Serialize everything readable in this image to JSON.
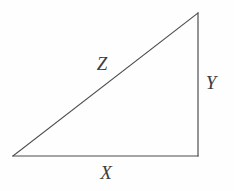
{
  "figure": {
    "type": "right-triangle-diagram",
    "background_color": "#fefefe",
    "stroke_color": "#4d4d4d",
    "stroke_width": 1.2,
    "label_color": "#3d3d3d",
    "width": 234,
    "height": 191,
    "vertices": {
      "left": {
        "x": 13,
        "y": 156
      },
      "bottom_right": {
        "x": 198,
        "y": 156
      },
      "top_right": {
        "x": 198,
        "y": 13
      }
    },
    "sides": [
      {
        "name": "hypotenuse",
        "label": "Z",
        "from": "left",
        "to": "top_right",
        "label_x": 102,
        "label_y": 63
      },
      {
        "name": "base",
        "label": "X",
        "from": "left",
        "to": "bottom_right",
        "label_x": 106,
        "label_y": 172
      },
      {
        "name": "vertical-leg",
        "label": "Y",
        "from": "bottom_right",
        "to": "top_right",
        "label_x": 211,
        "label_y": 82
      }
    ]
  }
}
